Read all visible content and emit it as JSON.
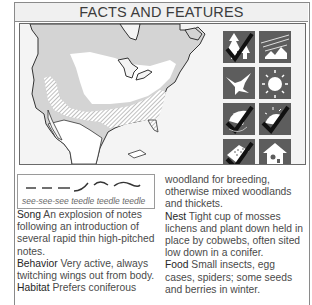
{
  "header": {
    "title": "FACTS AND FEATURES"
  },
  "map": {
    "description": "Range map of North America",
    "legend_fills": {
      "summer_range": "#d4d4d4",
      "breeding_range_white": "#ffffff",
      "winter_hatched": "#9a9a9a",
      "water": "#f4f4f4"
    }
  },
  "icons": [
    {
      "name": "coniferous-forest-check-icon",
      "checked": true
    },
    {
      "name": "open-country-icon",
      "checked": false
    },
    {
      "name": "bird-flight-icon",
      "checked": false
    },
    {
      "name": "sun-icon",
      "checked": false
    },
    {
      "name": "cup-nest-check-icon",
      "checked": true
    },
    {
      "name": "nest-sun-check-icon",
      "checked": true
    },
    {
      "name": "food-check-icon",
      "checked": true
    },
    {
      "name": "birdhouse-icon",
      "checked": false
    }
  ],
  "song_box": {
    "caption": "see-see-see teedle teedle teedle"
  },
  "facts": {
    "song": {
      "label": "Song",
      "text": " An explosion of notes following an introduction of several rapid thin high-pitched notes."
    },
    "behavior": {
      "label": "Behavior",
      "text": " Very active, always twitching wings out from body."
    },
    "habitat": {
      "label": "Habitat",
      "text": " Prefers coniferous"
    },
    "habitat_cont": {
      "text": "woodland for breeding, otherwise mixed woodlands and thickets."
    },
    "nest": {
      "label": "Nest",
      "text": " Tight cup of mosses lichens and plant down held in place by cobwebs, often sited low down in a conifer."
    },
    "food": {
      "label": "Food",
      "text": " Small insects, egg cases, spiders; some seeds and berries in winter."
    }
  }
}
